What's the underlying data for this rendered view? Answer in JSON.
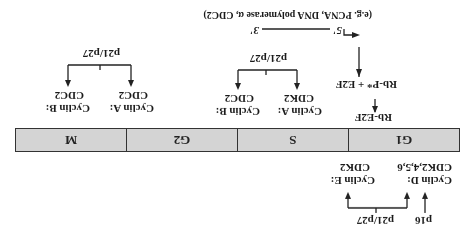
{
  "figure": {
    "orientation": "rotated 180 degrees",
    "phases": [
      {
        "label": "G1"
      },
      {
        "label": "S"
      },
      {
        "label": "G2"
      },
      {
        "label": "M"
      }
    ],
    "g1_top": {
      "inhibitor_p16": "p16",
      "inhibitor_p21p27": "p21/p27",
      "cyclin_d": {
        "line1": "Cyclin D:",
        "line2": "CDK2,4,5,6"
      },
      "cyclin_e": {
        "line1": "Cyclin E:",
        "line2": "CDK2"
      }
    },
    "g1_bottom": {
      "rb_e2f": "Rb-E2F",
      "rb_p_e2f": "Rb-P* + E2F",
      "gene_5": "5'",
      "gene_3": "3'",
      "targets": "(e.g. PCNA, DNA polymerase α, CDC2)"
    },
    "s_phase": {
      "inhibitor": "p21/p27",
      "cyclin_a": {
        "line1": "Cyclin A:",
        "line2": "CDK2"
      },
      "cyclin_b": {
        "line1": "Cyclin B:",
        "line2": "CDC2"
      }
    },
    "m_phase": {
      "inhibitor": "p21/p27",
      "cyclin_a": {
        "line1": "Cyclin A:",
        "line2": "CDC2"
      },
      "cyclin_b": {
        "line1": "Cyclin B:",
        "line2": "CDC2"
      }
    }
  }
}
